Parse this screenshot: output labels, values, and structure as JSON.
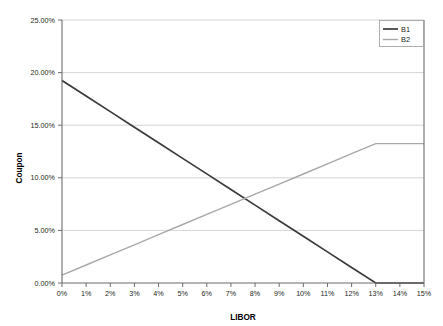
{
  "chart_data": {
    "type": "line",
    "title": "",
    "xlabel": "LIBOR",
    "ylabel": "Coupon",
    "xlim": [
      0,
      15
    ],
    "ylim": [
      0,
      25
    ],
    "grid": "horizontal",
    "legend_position": "top-right",
    "x": [
      0,
      1,
      2,
      3,
      4,
      5,
      6,
      7,
      8,
      9,
      10,
      11,
      12,
      13,
      14,
      15
    ],
    "xticklabels": [
      "0%",
      "1%",
      "2%",
      "3%",
      "4%",
      "5%",
      "6%",
      "7%",
      "8%",
      "9%",
      "10%",
      "11%",
      "12%",
      "13%",
      "14%",
      "15%"
    ],
    "yticks": [
      0,
      5,
      10,
      15,
      20,
      25
    ],
    "yticklabels": [
      "0.00%",
      "5.00%",
      "10.00%",
      "15.00%",
      "20.00%",
      "25.00%"
    ],
    "series": [
      {
        "name": "B1",
        "color": "#3a3a3a",
        "width": 1.7,
        "values": [
          19.25,
          17.77,
          16.29,
          14.81,
          13.33,
          11.85,
          10.37,
          8.88,
          7.4,
          5.92,
          4.44,
          2.96,
          1.48,
          0.0,
          0.0,
          0.0
        ]
      },
      {
        "name": "B2",
        "color": "#a8a8a8",
        "width": 1.4,
        "values": [
          0.75,
          1.71,
          2.67,
          3.63,
          4.59,
          5.56,
          6.52,
          7.48,
          8.44,
          9.4,
          10.36,
          11.33,
          12.29,
          13.25,
          13.25,
          13.25
        ]
      }
    ]
  },
  "legend": {
    "entries": [
      {
        "label": "B1"
      },
      {
        "label": "B2"
      }
    ]
  },
  "axes": {
    "y_title": "Coupon",
    "x_title": "LIBOR"
  }
}
